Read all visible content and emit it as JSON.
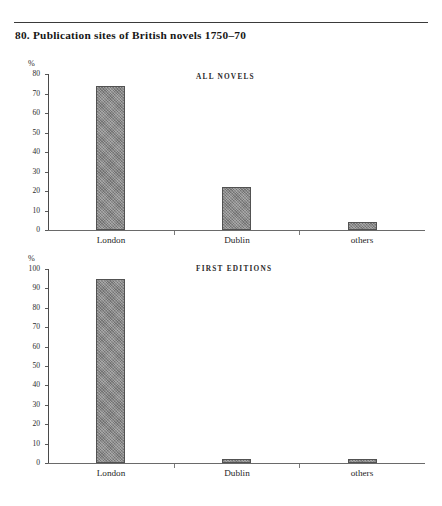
{
  "figure": {
    "number": "80.",
    "title": "80.  Publication sites of British novels 1750–70",
    "axis_unit": "%"
  },
  "chart_data": [
    {
      "type": "bar",
      "title": "ALL NOVELS",
      "categories": [
        "London",
        "Dublin",
        "others"
      ],
      "values": [
        74,
        22,
        4
      ],
      "xlabel": "",
      "ylabel": "%",
      "ylim": [
        0,
        80
      ],
      "yticks": [
        0,
        10,
        20,
        30,
        40,
        50,
        60,
        70,
        80
      ],
      "ytick_labels": [
        "0",
        "10",
        "20",
        "30",
        "40",
        "50",
        "60",
        "70",
        "80"
      ],
      "grid": false,
      "legend": "none"
    },
    {
      "type": "bar",
      "title": "FIRST EDITIONS",
      "categories": [
        "London",
        "Dublin",
        "others"
      ],
      "values": [
        95,
        2,
        2
      ],
      "xlabel": "",
      "ylabel": "%",
      "ylim": [
        0,
        100
      ],
      "yticks": [
        0,
        10,
        20,
        30,
        40,
        50,
        60,
        70,
        80,
        90,
        100
      ],
      "ytick_labels": [
        "0",
        "10",
        "20",
        "30",
        "40",
        "50",
        "60",
        "70",
        "80",
        "90",
        "100"
      ],
      "grid": false,
      "legend": "none"
    }
  ],
  "colors": {
    "bar_fill": "#8a8a8a",
    "bar_border": "#525252",
    "axis": "#4a4a4a",
    "text": "#1b1b1b",
    "rule": "#3a3a3a",
    "page_background": "#ffffff"
  }
}
